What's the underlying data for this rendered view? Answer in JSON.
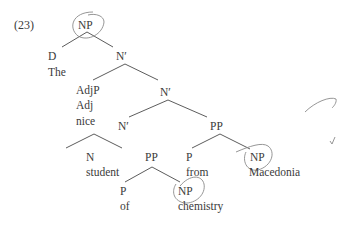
{
  "example_number": "(23)",
  "nodes": {
    "np_root": "NP",
    "d": "D",
    "the": "The",
    "nbar1": "N′",
    "adjp": "AdjP",
    "adj": "Adj",
    "nice": "nice",
    "nbar2": "N′",
    "nbar3": "N′",
    "pp1": "PP",
    "n": "N",
    "student": "student",
    "pp2": "PP",
    "p1": "P",
    "from": "from",
    "np_macedonia": "NP",
    "macedonia": "Macedonia",
    "p2": "P",
    "of": "of",
    "np_chemistry": "NP",
    "chemistry": "chemistry"
  },
  "annotations": {
    "circled_nodes": [
      "NP (root)",
      "NP (Macedonia)",
      "NP (chemistry)"
    ],
    "stroke_color": "#8a8a8a",
    "line_color": "#4a4a4a"
  }
}
